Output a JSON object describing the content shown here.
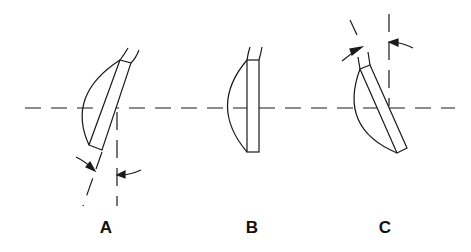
{
  "diagram": {
    "colors": {
      "stroke": "#1a1a1a",
      "background": "#ffffff"
    },
    "figures": [
      {
        "id": "A",
        "label": "A",
        "orientation": "tilted clockwise (top to right)",
        "label_x": 130,
        "label_y": 218
      },
      {
        "id": "B",
        "label": "B",
        "orientation": "perpendicular to axis",
        "label_x": 252,
        "label_y": 218
      },
      {
        "id": "C",
        "label": "C",
        "orientation": "tilted counter-clockwise (top to left)",
        "label_x": 385,
        "label_y": 218
      }
    ],
    "optical_axis_y": 108
  }
}
